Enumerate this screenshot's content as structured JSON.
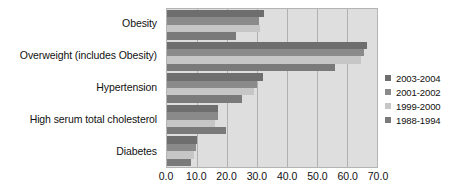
{
  "chart_data": {
    "type": "bar",
    "orientation": "horizontal",
    "title": "",
    "subtitle": "",
    "xlabel": "",
    "ylabel": "",
    "xlim": [
      0.0,
      70.0
    ],
    "xticks": [
      "0.0",
      "10.0",
      "20.0",
      "30.0",
      "40.0",
      "50.0",
      "60.0",
      "70.0"
    ],
    "xtick_values": [
      0,
      10,
      20,
      30,
      40,
      50,
      60,
      70
    ],
    "grid": true,
    "grid_axis": "x",
    "legend_position": "right",
    "categories": [
      "Obesity",
      "Overweight (includes Obesity)",
      "Hypertension",
      "High serum total cholesterol",
      "Diabetes"
    ],
    "series": [
      {
        "name": "2003-2004",
        "color": "#6e6e6e",
        "values": [
          32.2,
          66.5,
          32.1,
          16.9,
          10.0
        ]
      },
      {
        "name": "2001-2002",
        "color": "#8a8a8a",
        "values": [
          30.6,
          65.7,
          30.0,
          17.1,
          9.8
        ]
      },
      {
        "name": "1999-2000",
        "color": "#c6c6c6",
        "values": [
          30.9,
          64.5,
          28.9,
          16.0,
          8.9
        ]
      },
      {
        "name": "1988-1994",
        "color": "#7a7a7a",
        "values": [
          22.9,
          56.0,
          25.0,
          19.6,
          7.9
        ]
      }
    ]
  },
  "legend": {
    "items": [
      {
        "label": "2003-2004",
        "color": "#6e6e6e"
      },
      {
        "label": "2001-2002",
        "color": "#8a8a8a"
      },
      {
        "label": "1999-2000",
        "color": "#c6c6c6"
      },
      {
        "label": "1988-1994",
        "color": "#7a7a7a"
      }
    ]
  },
  "colors": {
    "plot_background": "#dedede",
    "page_background": "#ffffff",
    "gridline": "#b0b0b0",
    "axis_border": "#b4b4b4",
    "text": "#111111"
  }
}
